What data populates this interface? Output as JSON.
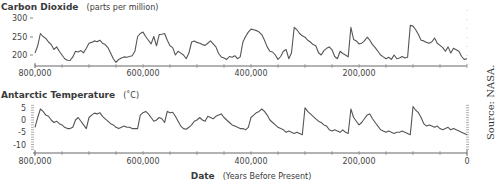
{
  "chart_data": [
    {
      "type": "line",
      "title": "Carbon Dioxide",
      "title_unit": "(parts per million)",
      "xlabel": "",
      "ylabel": "Carbon Dioxide (ppm)",
      "xlim": [
        800000,
        0
      ],
      "ylim": [
        180,
        300
      ],
      "yticks": [
        200,
        250,
        300
      ],
      "xticks": [
        800000,
        600000,
        400000,
        200000
      ],
      "xtick_labels": [
        "800,000",
        "600,000",
        "400,000",
        "200,000"
      ],
      "grid": false,
      "color": "#555555",
      "series": [
        {
          "name": "CO2",
          "x": [
            800000,
            795000,
            790000,
            785000,
            780000,
            775000,
            770000,
            765000,
            760000,
            755000,
            750000,
            745000,
            740000,
            735000,
            730000,
            725000,
            720000,
            715000,
            710000,
            705000,
            700000,
            695000,
            690000,
            685000,
            680000,
            675000,
            670000,
            665000,
            660000,
            655000,
            650000,
            645000,
            640000,
            635000,
            630000,
            625000,
            620000,
            615000,
            610000,
            605000,
            600000,
            595000,
            590000,
            585000,
            580000,
            575000,
            570000,
            565000,
            560000,
            555000,
            550000,
            545000,
            540000,
            535000,
            530000,
            525000,
            520000,
            515000,
            510000,
            505000,
            500000,
            495000,
            490000,
            485000,
            480000,
            475000,
            470000,
            465000,
            460000,
            455000,
            450000,
            445000,
            440000,
            435000,
            430000,
            425000,
            420000,
            415000,
            410000,
            405000,
            400000,
            395000,
            390000,
            385000,
            380000,
            375000,
            370000,
            365000,
            360000,
            355000,
            350000,
            345000,
            340000,
            335000,
            330000,
            325000,
            320000,
            315000,
            310000,
            305000,
            300000,
            295000,
            290000,
            285000,
            280000,
            275000,
            270000,
            265000,
            260000,
            255000,
            250000,
            245000,
            240000,
            235000,
            230000,
            225000,
            220000,
            215000,
            210000,
            205000,
            200000,
            195000,
            190000,
            185000,
            180000,
            175000,
            170000,
            165000,
            160000,
            155000,
            150000,
            145000,
            140000,
            135000,
            130000,
            125000,
            120000,
            115000,
            110000,
            105000,
            100000,
            95000,
            90000,
            85000,
            80000,
            75000,
            70000,
            65000,
            60000,
            55000,
            50000,
            45000,
            40000,
            35000,
            30000,
            25000,
            20000,
            15000,
            10000,
            5000,
            0
          ],
          "values": [
            205,
            225,
            258,
            250,
            245,
            235,
            228,
            215,
            222,
            210,
            200,
            190,
            186,
            185,
            195,
            210,
            208,
            212,
            206,
            218,
            232,
            234,
            238,
            236,
            240,
            232,
            228,
            220,
            205,
            190,
            180,
            188,
            192,
            195,
            194,
            196,
            198,
            210,
            250,
            258,
            262,
            250,
            240,
            230,
            250,
            225,
            255,
            256,
            258,
            240,
            225,
            220,
            200,
            210,
            205,
            200,
            190,
            205,
            235,
            238,
            234,
            232,
            228,
            226,
            232,
            238,
            230,
            222,
            204,
            195,
            192,
            188,
            196,
            194,
            198,
            190,
            195,
            235,
            250,
            262,
            270,
            268,
            266,
            262,
            255,
            240,
            222,
            210,
            208,
            200,
            188,
            196,
            210,
            215,
            190,
            206,
            275,
            268,
            258,
            252,
            248,
            240,
            235,
            228,
            225,
            206,
            200,
            212,
            218,
            222,
            214,
            196,
            190,
            210,
            204,
            200,
            195,
            275,
            242,
            238,
            230,
            232,
            238,
            248,
            240,
            228,
            220,
            210,
            200,
            195,
            190,
            194,
            188,
            200,
            190,
            192,
            196,
            192,
            194,
            280,
            278,
            268,
            255,
            240,
            238,
            234,
            232,
            236,
            246,
            232,
            226,
            220,
            210,
            222,
            205,
            218,
            214,
            210,
            196,
            188,
            190,
            260,
            268,
            276,
            280,
            285
          ]
        }
      ]
    },
    {
      "type": "line",
      "title": "Antarctic Temperature",
      "title_unit": "(˚C)",
      "xlabel": "Date (Years Before Present)",
      "ylabel": "Antarctic Temperature (°C)",
      "xlim": [
        800000,
        0
      ],
      "ylim": [
        -12,
        6
      ],
      "yticks": [
        5,
        0,
        -5,
        -10
      ],
      "xticks": [
        800000,
        600000,
        400000,
        200000,
        0
      ],
      "xtick_labels": [
        "800,000",
        "600,000",
        "400,000",
        "200,000",
        "0"
      ],
      "grid": false,
      "color": "#555555",
      "series": [
        {
          "name": "Temperature",
          "x": [
            800000,
            795000,
            790000,
            785000,
            780000,
            775000,
            770000,
            765000,
            760000,
            755000,
            750000,
            745000,
            740000,
            735000,
            730000,
            725000,
            720000,
            715000,
            710000,
            705000,
            700000,
            695000,
            690000,
            685000,
            680000,
            675000,
            670000,
            665000,
            660000,
            655000,
            650000,
            645000,
            640000,
            635000,
            630000,
            625000,
            620000,
            615000,
            610000,
            605000,
            600000,
            595000,
            590000,
            585000,
            580000,
            575000,
            570000,
            565000,
            560000,
            555000,
            550000,
            545000,
            540000,
            535000,
            530000,
            525000,
            520000,
            515000,
            510000,
            505000,
            500000,
            495000,
            490000,
            485000,
            480000,
            475000,
            470000,
            465000,
            460000,
            455000,
            450000,
            445000,
            440000,
            435000,
            430000,
            425000,
            420000,
            415000,
            410000,
            405000,
            400000,
            395000,
            390000,
            385000,
            380000,
            375000,
            370000,
            365000,
            360000,
            355000,
            350000,
            345000,
            340000,
            335000,
            330000,
            325000,
            320000,
            315000,
            310000,
            305000,
            300000,
            295000,
            290000,
            285000,
            280000,
            275000,
            270000,
            265000,
            260000,
            255000,
            250000,
            245000,
            240000,
            235000,
            230000,
            225000,
            220000,
            215000,
            210000,
            205000,
            200000,
            195000,
            190000,
            185000,
            180000,
            175000,
            170000,
            165000,
            160000,
            155000,
            150000,
            145000,
            140000,
            135000,
            130000,
            125000,
            120000,
            115000,
            110000,
            105000,
            100000,
            95000,
            90000,
            85000,
            80000,
            75000,
            70000,
            65000,
            60000,
            55000,
            50000,
            45000,
            40000,
            35000,
            30000,
            25000,
            20000,
            15000,
            10000,
            5000,
            0
          ],
          "values": [
            -3,
            1,
            4.5,
            3.5,
            2,
            1.5,
            0,
            -1,
            -0.5,
            -1.5,
            -2,
            -3,
            -3.5,
            -3.5,
            -3,
            0,
            1,
            -0.5,
            -2,
            -3.5,
            1,
            2,
            2.8,
            2.5,
            3,
            1.5,
            0.5,
            -0.5,
            -1.5,
            -2,
            -3,
            -3.5,
            -3,
            -2.5,
            -3,
            -3,
            -3.5,
            -3.5,
            -3.5,
            2,
            3,
            3.5,
            2.5,
            1,
            -0.5,
            0,
            1,
            0.5,
            -1,
            3.5,
            3,
            3.2,
            1.5,
            -0.5,
            -2.5,
            -3.5,
            -3.8,
            -3,
            -2,
            -0.5,
            0,
            1,
            0,
            -0.5,
            1.5,
            1,
            0.5,
            1.5,
            2,
            2.5,
            1,
            0,
            -1,
            -2,
            -2.5,
            -3,
            -3.5,
            -3.5,
            -4,
            -3,
            1,
            2,
            3,
            3.5,
            4.5,
            3.5,
            2,
            0,
            -1,
            -2,
            -3,
            -3.5,
            -4,
            -5,
            -4.5,
            -5,
            -5.5,
            -5,
            -5.5,
            -6,
            5,
            3.5,
            2.5,
            1.5,
            0.5,
            -0.5,
            -1,
            -2,
            -2.5,
            -4,
            -4.5,
            -4,
            -4.5,
            -5,
            -4,
            -5,
            -5.5,
            4.5,
            1,
            -0.5,
            -2,
            -1,
            0.5,
            2,
            2.5,
            0.5,
            -1,
            -2.5,
            -4,
            -4.5,
            -5,
            -4.5,
            -5,
            -5.5,
            -5,
            -5,
            -4.5,
            -5,
            -5.5,
            -6,
            5.5,
            4,
            3,
            1,
            -1.5,
            -2.5,
            -2,
            -2.5,
            -3,
            -2.5,
            -3.5,
            -4,
            -3.5,
            -3,
            -4,
            -3.5,
            -4,
            -4.5,
            -5,
            -5.5,
            -6,
            1,
            3,
            4,
            4.5,
            5
          ]
        }
      ]
    }
  ],
  "co2": {
    "title_bold": "Carbon Dioxide",
    "title_rest": "(parts per million)",
    "yticks": [
      "300",
      "250",
      "200"
    ],
    "xticks": [
      "800,000",
      "600,000",
      "400,000",
      "200,000"
    ]
  },
  "temp": {
    "title_bold": "Antarctic Temperature",
    "title_rest": "(˚C)",
    "yticks": [
      "5",
      "0",
      "-5",
      "-10"
    ],
    "xticks": [
      "800,000",
      "600,000",
      "400,000",
      "200,000",
      "0"
    ]
  },
  "xaxis": {
    "label_bold": "Date",
    "label_rest": "(Years Before Present)"
  },
  "source": "Source: NASA."
}
